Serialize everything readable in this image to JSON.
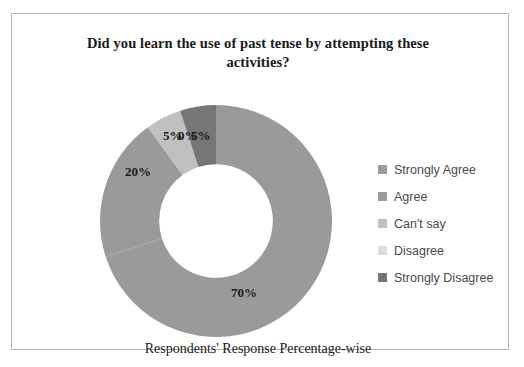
{
  "chart_data": {
    "type": "pie",
    "variant": "donut",
    "title": "Did you learn the use of past tense by attempting these activities?",
    "caption": "Respondents' Response Percentage-wise",
    "xlabel": "",
    "ylabel": "",
    "legend_position": "right",
    "grid": false,
    "hole_ratio": 0.49,
    "start_angle_deg": 0,
    "direction": "clockwise",
    "units": "%",
    "categories": [
      "Strongly Agree",
      "Agree",
      "Can't say",
      "Disagree",
      "Strongly Disagree"
    ],
    "values": [
      70,
      20,
      5,
      0,
      5
    ],
    "data_labels": [
      "70%",
      "20%",
      "5%",
      "0%",
      "5%"
    ],
    "colors": [
      "#9a9a9a",
      "#9a9a9a",
      "#c0c0c0",
      "#dcdcdc",
      "#767676"
    ],
    "slices": [
      {
        "label": "Strongly Agree",
        "value": 70,
        "display": "70%",
        "color": "#9a9a9a"
      },
      {
        "label": "Agree",
        "value": 20,
        "display": "20%",
        "color": "#9a9a9a"
      },
      {
        "label": "Can't say",
        "value": 5,
        "display": "5%",
        "color": "#c0c0c0"
      },
      {
        "label": "Disagree",
        "value": 0,
        "display": "0%",
        "color": "#dcdcdc"
      },
      {
        "label": "Strongly Disagree",
        "value": 5,
        "display": "5%",
        "color": "#767676"
      }
    ]
  },
  "title": {
    "line1": "Did you learn the use of past tense by attempting these",
    "line2": "activities?"
  },
  "caption": {
    "text": "Respondents' Response Percentage-wise"
  },
  "labels": {
    "seventy": "70%",
    "twenty": "20%",
    "five_cant_say": "5%",
    "zero_disagree": "0%",
    "five_strongly_disagree": "5%"
  },
  "legend": {
    "items": [
      {
        "label": "Strongly Agree",
        "color": "#9a9a9a"
      },
      {
        "label": "Agree",
        "color": "#9a9a9a"
      },
      {
        "label": "Can't say",
        "color": "#c0c0c0"
      },
      {
        "label": "Disagree",
        "color": "#dcdcdc"
      },
      {
        "label": "Strongly Disagree",
        "color": "#767676"
      }
    ]
  }
}
